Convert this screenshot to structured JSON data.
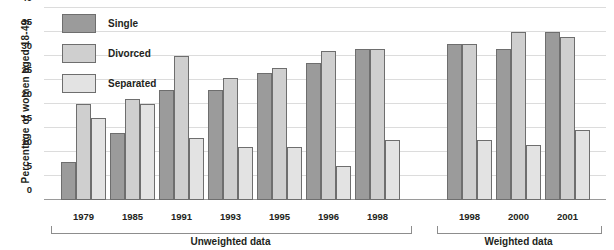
{
  "chart_data": {
    "type": "bar",
    "title": "",
    "xlabel": "",
    "ylabel": "Percentage of  women aged 18-49",
    "ylim": [
      0,
      40
    ],
    "yticks": [
      0,
      5,
      10,
      15,
      20,
      25,
      30,
      35,
      40
    ],
    "grid": true,
    "legend_position": "top-left",
    "categories": [
      "1979",
      "1985",
      "1991",
      "1993",
      "1995",
      "1996",
      "1998",
      "1998",
      "2000",
      "2001"
    ],
    "series": [
      {
        "name": "Single",
        "color": "#9b9b9b",
        "values": [
          8,
          14,
          23,
          23,
          26.5,
          28.5,
          31.5,
          32.5,
          31.5,
          35
        ]
      },
      {
        "name": "Divorced",
        "color": "#cfcfcf",
        "values": [
          20,
          21,
          30,
          25.5,
          27.5,
          31,
          31.5,
          32.5,
          35,
          34
        ]
      },
      {
        "name": "Separated",
        "color": "#e3e3e3",
        "values": [
          17,
          20,
          13,
          11,
          11,
          7,
          12.5,
          12.5,
          11.5,
          14.5
        ]
      }
    ],
    "sections": [
      {
        "label": "Unweighted data",
        "categories": [
          "1979",
          "1985",
          "1991",
          "1993",
          "1995",
          "1996",
          "1998"
        ]
      },
      {
        "label": "Weighted data",
        "categories": [
          "1998",
          "2000",
          "2001"
        ]
      }
    ]
  },
  "legend": {
    "items": [
      {
        "label": "Single",
        "color": "#9b9b9b"
      },
      {
        "label": "Divorced",
        "color": "#cfcfcf"
      },
      {
        "label": "Separated",
        "color": "#e3e3e3"
      }
    ]
  }
}
